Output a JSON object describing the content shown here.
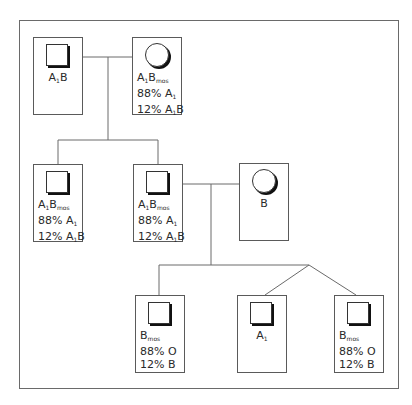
{
  "diagram": {
    "type": "pedigree-chart",
    "individuals": [
      {
        "id": "gen1-male",
        "sex": "male",
        "name": "A",
        "sub": "1",
        "name2": "B",
        "sub2": "",
        "lines": []
      },
      {
        "id": "gen1-female",
        "sex": "female",
        "name": "A",
        "sub": "1",
        "name2": "B",
        "sub2": "mos",
        "lines": [
          [
            "88% A",
            "1",
            ""
          ],
          [
            "12% A",
            "1",
            "B"
          ]
        ]
      },
      {
        "id": "gen2-male-1",
        "sex": "male",
        "name": "A",
        "sub": "1",
        "name2": "B",
        "sub2": "mos",
        "lines": [
          [
            "88% A",
            "1",
            ""
          ],
          [
            "12% A",
            "1",
            "B"
          ]
        ]
      },
      {
        "id": "gen2-male-2",
        "sex": "male",
        "name": "A",
        "sub": "1",
        "name2": "B",
        "sub2": "mos",
        "lines": [
          [
            "88% A",
            "1",
            ""
          ],
          [
            "12% A",
            "1",
            "B"
          ]
        ]
      },
      {
        "id": "gen2-female-spouse",
        "sex": "female",
        "name": "B",
        "sub": "",
        "name2": "",
        "sub2": "",
        "lines": []
      },
      {
        "id": "gen3-male-1",
        "sex": "male",
        "name": "B",
        "sub": "mos",
        "name2": "",
        "sub2": "",
        "lines": [
          [
            "88% O",
            "",
            ""
          ],
          [
            "12% B",
            "",
            ""
          ]
        ]
      },
      {
        "id": "gen3-male-2",
        "sex": "male",
        "name": "A",
        "sub": "1",
        "name2": "",
        "sub2": "",
        "lines": []
      },
      {
        "id": "gen3-male-3",
        "sex": "male",
        "name": "B",
        "sub": "mos",
        "name2": "",
        "sub2": "",
        "lines": [
          [
            "88% O",
            "",
            ""
          ],
          [
            "12% B",
            "",
            ""
          ]
        ]
      }
    ],
    "labels": {
      "p1": {
        "a": "A",
        "s": "1",
        "b": "B"
      },
      "p2": {
        "a": "A",
        "s": "1",
        "b": "B",
        "s2": "mos",
        "l1a": "88% A",
        "l1s": "1",
        "l2a": "12% A",
        "l2s": "1",
        "l2b": "B"
      },
      "p5": {
        "a": "B"
      },
      "p6": {
        "a": "B",
        "s": "mos",
        "l1": "88% O",
        "l2": "12% B"
      },
      "p7": {
        "a": "A",
        "s": "1"
      }
    }
  }
}
